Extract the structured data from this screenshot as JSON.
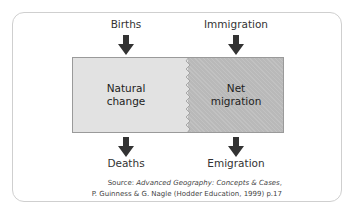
{
  "diagram": {
    "inputs": [
      {
        "label": "Births"
      },
      {
        "label": "Immigration"
      }
    ],
    "outputs": [
      {
        "label": "Deaths"
      },
      {
        "label": "Emigration"
      }
    ],
    "boxes": [
      {
        "line1": "Natural",
        "line2": "change",
        "fill": "#e2e2e2"
      },
      {
        "line1": "Net",
        "line2": "migration",
        "fill": "#b9b9b9"
      }
    ],
    "arrow_color": "#333333",
    "source": {
      "prefix": "Source: ",
      "title": "Advanced Geography: Concepts & Cases",
      "suffix": ",",
      "line2": "P. Guinness & G. Nagle (Hodder Education, 1999) p.17"
    }
  }
}
